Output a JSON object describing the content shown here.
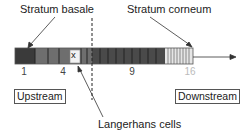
{
  "labels": {
    "top_left": "Stratum basale",
    "top_right": "Stratum corneum",
    "bottom": "Langerhans cells",
    "upstream": "Upstream",
    "downstream": "Downstream"
  },
  "cell_marker": "x",
  "position_labels": [
    {
      "text": "1",
      "x": 24,
      "faded": false
    },
    {
      "text": "4",
      "x": 63,
      "faded": false
    },
    {
      "text": "9",
      "x": 132,
      "faded": false
    },
    {
      "text": "16",
      "x": 190,
      "faded": true
    }
  ],
  "colors": {
    "basale": "#3a3a3a",
    "spinous": "#6e6e6e",
    "granular": "#4a4a4a",
    "corneum": "#e6e6e6",
    "divider": "#222222",
    "dashed": "#222222"
  }
}
